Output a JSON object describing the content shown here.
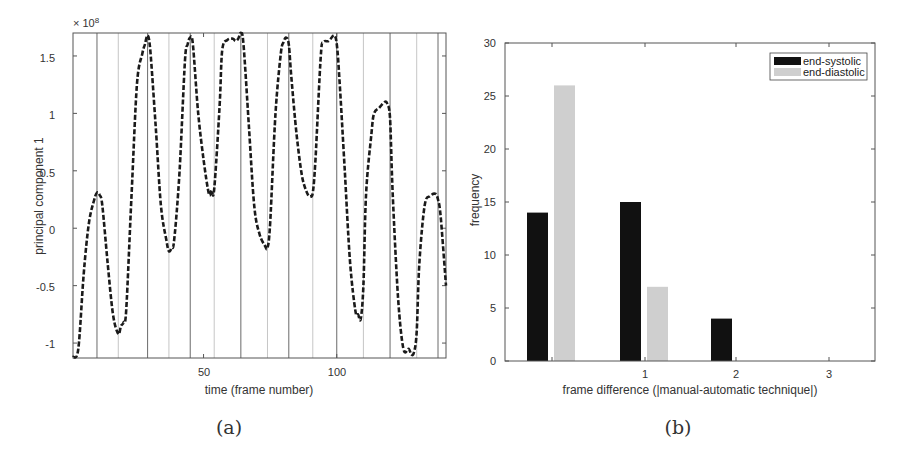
{
  "chart_data": [
    {
      "type": "line",
      "panel": "(a)",
      "title": "",
      "xlabel": "time (frame number)",
      "ylabel": "principal component 1",
      "y_exponent_label": "× 10^8",
      "xlim": [
        1,
        141
      ],
      "ylim": [
        -1.13,
        1.7
      ],
      "xticks": [
        50,
        100
      ],
      "yticks": [
        -1,
        -0.5,
        0,
        0.5,
        1,
        1.5
      ],
      "ytick_labels": [
        "-1",
        "-0.5",
        "0",
        "0.5",
        "1",
        "1.5"
      ],
      "line_style": "dashed black",
      "vertical_markers": [
        {
          "x": 10,
          "style": "dark"
        },
        {
          "x": 18,
          "style": "light"
        },
        {
          "x": 29,
          "style": "dark"
        },
        {
          "x": 37,
          "style": "light"
        },
        {
          "x": 45,
          "style": "dark"
        },
        {
          "x": 54,
          "style": "light"
        },
        {
          "x": 64,
          "style": "dark"
        },
        {
          "x": 74,
          "style": "light"
        },
        {
          "x": 82,
          "style": "dark"
        },
        {
          "x": 91,
          "style": "light"
        },
        {
          "x": 100,
          "style": "dark"
        },
        {
          "x": 110,
          "style": "light"
        },
        {
          "x": 120,
          "style": "dark"
        },
        {
          "x": 130,
          "style": "light"
        },
        {
          "x": 138,
          "style": "dark"
        }
      ],
      "series": [
        {
          "name": "principal component 1",
          "x": [
            1,
            3,
            5,
            7,
            9,
            10,
            11,
            12,
            14,
            16,
            18,
            19,
            20,
            21,
            23,
            25,
            27,
            28,
            29,
            30,
            32,
            34,
            36,
            37,
            38,
            39,
            41,
            43,
            44,
            45,
            46,
            48,
            50,
            52,
            53,
            54,
            56,
            57,
            59,
            61,
            62,
            63,
            64,
            65,
            67,
            69,
            71,
            73,
            74,
            75,
            77,
            79,
            80,
            81,
            82,
            83,
            85,
            87,
            89,
            90,
            91,
            92,
            94,
            95,
            97,
            99,
            100,
            101,
            103,
            105,
            107,
            108,
            109,
            110,
            111,
            113,
            114,
            116,
            118,
            119,
            120,
            121,
            123,
            125,
            127,
            128,
            129,
            130,
            131,
            133,
            135,
            137,
            138,
            139,
            141
          ],
          "values": [
            -1.12,
            -1.05,
            -0.4,
            0.05,
            0.25,
            0.31,
            0.29,
            0.2,
            -0.3,
            -0.75,
            -0.92,
            -0.85,
            -0.82,
            -0.7,
            0.3,
            1.25,
            1.52,
            1.6,
            1.68,
            1.55,
            0.9,
            0.2,
            -0.1,
            -0.2,
            -0.17,
            -0.1,
            0.5,
            1.45,
            1.6,
            1.66,
            1.6,
            1.0,
            0.6,
            0.3,
            0.33,
            0.34,
            1.05,
            1.55,
            1.64,
            1.65,
            1.63,
            1.65,
            1.7,
            1.6,
            0.9,
            0.2,
            -0.05,
            -0.15,
            -0.17,
            0.05,
            1.0,
            1.52,
            1.62,
            1.66,
            1.6,
            1.3,
            0.8,
            0.45,
            0.3,
            0.28,
            0.31,
            0.6,
            1.5,
            1.62,
            1.63,
            1.68,
            1.6,
            1.3,
            0.5,
            -0.3,
            -0.72,
            -0.75,
            -0.79,
            -0.5,
            0.3,
            0.82,
            1.0,
            1.05,
            1.1,
            1.08,
            0.95,
            0.3,
            -0.6,
            -1.05,
            -1.05,
            -1.1,
            -1.08,
            -0.9,
            -0.3,
            0.2,
            0.28,
            0.3,
            0.25,
            0.1,
            -0.5
          ]
        }
      ]
    },
    {
      "type": "bar",
      "panel": "(b)",
      "title": "",
      "xlabel": "frame difference (|manual-automatic technique|)",
      "ylabel": "frequency",
      "categories": [
        0,
        1,
        2,
        3
      ],
      "xtick_labels": [
        "",
        "1",
        "2",
        "3"
      ],
      "ylim": [
        0,
        30
      ],
      "yticks": [
        0,
        5,
        10,
        15,
        20,
        25,
        30
      ],
      "legend_position": "upper right",
      "series": [
        {
          "name": "end-systolic",
          "color": "#111111",
          "values": [
            14,
            15,
            4,
            0
          ]
        },
        {
          "name": "end-diastolic",
          "color": "#cfcfcf",
          "values": [
            26,
            7,
            0,
            0
          ]
        }
      ]
    }
  ],
  "captions": {
    "a": "(a)",
    "b": "(b)"
  },
  "left": {
    "exponent": "× 10",
    "exponent_power": "8",
    "xlabel": "time (frame number)",
    "ylabel": "principal component 1",
    "xticks": [
      "50",
      "100"
    ],
    "yticks": [
      "1.5",
      "1",
      "0.5",
      "0",
      "-0.5",
      "-1"
    ]
  },
  "right": {
    "xlabel": "frame difference (|manual-automatic technique|)",
    "ylabel": "frequency",
    "xticks": [
      "1",
      "2",
      "3"
    ],
    "yticks": [
      "30",
      "25",
      "20",
      "15",
      "10",
      "5",
      "0"
    ],
    "legend": [
      "end-systolic",
      "end-diastolic"
    ]
  }
}
